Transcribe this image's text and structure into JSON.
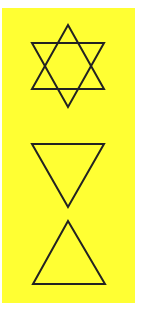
{
  "card": {
    "background_color": "#ffff33",
    "stroke_color": "#222222",
    "symbols": [
      {
        "name": "hexagram",
        "label": "Six-pointed star"
      },
      {
        "name": "downward-triangle",
        "label": "Downward-pointing triangle"
      },
      {
        "name": "upward-triangle",
        "label": "Upward-pointing triangle"
      }
    ]
  }
}
